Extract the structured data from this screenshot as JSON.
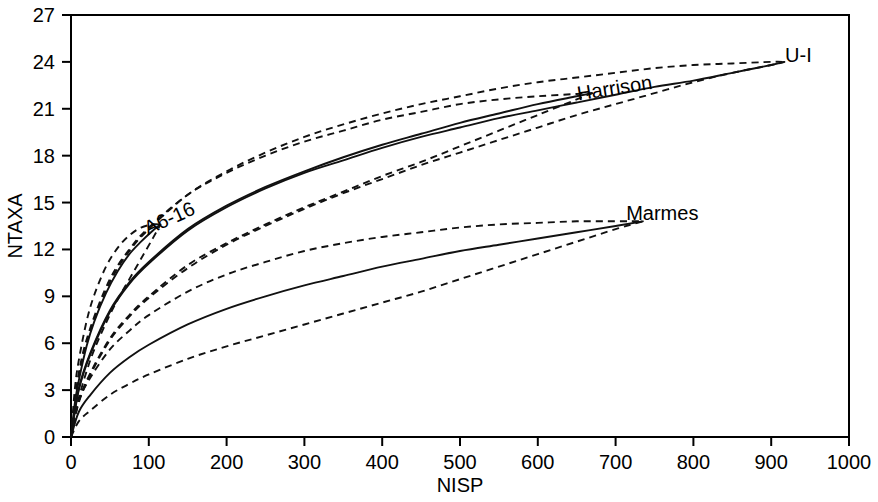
{
  "chart_data": {
    "type": "line",
    "title": "",
    "xlabel": "NISP",
    "ylabel": "NTAXA",
    "xlim": [
      0,
      1000
    ],
    "ylim": [
      0,
      27
    ],
    "xticks": [
      0,
      100,
      200,
      300,
      400,
      500,
      600,
      700,
      800,
      900,
      1000
    ],
    "yticks": [
      0,
      3,
      6,
      9,
      12,
      15,
      18,
      21,
      24,
      27
    ],
    "grid": false,
    "legend_position": "inline-annotations",
    "annotations": [
      {
        "text": "U-I",
        "x": 935,
        "y": 24.0
      },
      {
        "text": "Harrison",
        "x": 700,
        "y": 21.9
      },
      {
        "text": "A6-16",
        "x": 130,
        "y": 13.6
      },
      {
        "text": "Marmes",
        "x": 760,
        "y": 13.9
      }
    ],
    "series": [
      {
        "name": "U-I",
        "style": "solid",
        "role": "rarefaction-curve",
        "x": [
          0,
          10,
          25,
          50,
          75,
          100,
          150,
          200,
          250,
          300,
          350,
          400,
          450,
          500,
          550,
          600,
          650,
          700,
          750,
          800,
          850,
          900,
          917
        ],
        "y": [
          0,
          3.0,
          5.3,
          8.0,
          9.8,
          11.1,
          13.2,
          14.7,
          15.9,
          16.9,
          17.7,
          18.5,
          19.2,
          19.8,
          20.4,
          20.9,
          21.4,
          21.9,
          22.4,
          22.8,
          23.3,
          23.8,
          24.0
        ]
      },
      {
        "name": "U-I upper CI",
        "style": "dashed",
        "role": "confidence-upper",
        "x": [
          0,
          10,
          25,
          50,
          75,
          100,
          150,
          200,
          250,
          300,
          350,
          400,
          450,
          500,
          550,
          600,
          650,
          700,
          750,
          800,
          850,
          900,
          917
        ],
        "y": [
          0,
          3.9,
          6.8,
          9.9,
          11.9,
          13.3,
          15.5,
          17.0,
          18.2,
          19.2,
          20.0,
          20.7,
          21.3,
          21.8,
          22.3,
          22.7,
          23.0,
          23.3,
          23.6,
          23.8,
          23.9,
          24.0,
          24.0
        ]
      },
      {
        "name": "U-I lower CI",
        "style": "dashed",
        "role": "confidence-lower",
        "x": [
          0,
          10,
          25,
          50,
          75,
          100,
          150,
          200,
          250,
          300,
          350,
          400,
          450,
          500,
          550,
          600,
          650,
          700,
          750,
          800,
          850,
          900,
          917
        ],
        "y": [
          0,
          2.2,
          4.0,
          6.2,
          7.7,
          8.9,
          10.8,
          12.3,
          13.5,
          14.6,
          15.6,
          16.5,
          17.4,
          18.2,
          19.0,
          19.8,
          20.6,
          21.3,
          22.0,
          22.7,
          23.3,
          23.8,
          24.0
        ]
      },
      {
        "name": "Harrison",
        "style": "solid",
        "role": "rarefaction-curve",
        "x": [
          0,
          10,
          25,
          50,
          75,
          100,
          150,
          200,
          250,
          300,
          350,
          400,
          450,
          500,
          550,
          600,
          650,
          670
        ],
        "y": [
          0,
          3.1,
          5.4,
          8.1,
          9.9,
          11.2,
          13.3,
          14.8,
          16.0,
          17.0,
          17.9,
          18.7,
          19.4,
          20.1,
          20.7,
          21.3,
          21.8,
          22.0
        ]
      },
      {
        "name": "Harrison upper CI",
        "style": "dashed",
        "role": "confidence-upper",
        "x": [
          0,
          10,
          25,
          50,
          75,
          100,
          150,
          200,
          250,
          300,
          350,
          400,
          450,
          500,
          550,
          600,
          650,
          670
        ],
        "y": [
          0,
          4.1,
          7.0,
          10.1,
          12.0,
          13.4,
          15.5,
          16.9,
          18.0,
          18.9,
          19.6,
          20.3,
          20.8,
          21.3,
          21.6,
          21.8,
          21.95,
          22.0
        ]
      },
      {
        "name": "Harrison lower CI",
        "style": "dashed",
        "role": "confidence-lower",
        "x": [
          0,
          10,
          25,
          50,
          75,
          100,
          150,
          200,
          250,
          300,
          350,
          400,
          450,
          500,
          550,
          600,
          650,
          670
        ],
        "y": [
          0,
          2.3,
          4.1,
          6.3,
          7.8,
          9.0,
          11.0,
          12.4,
          13.6,
          14.7,
          15.7,
          16.7,
          17.6,
          18.6,
          19.6,
          20.6,
          21.6,
          22.0
        ]
      },
      {
        "name": "A6-16",
        "style": "solid",
        "role": "rarefaction-curve",
        "x": [
          0,
          5,
          10,
          20,
          30,
          45,
          60,
          75,
          90,
          105,
          115
        ],
        "y": [
          0,
          2.2,
          3.6,
          5.8,
          7.4,
          9.2,
          10.6,
          11.7,
          12.5,
          13.2,
          13.6
        ]
      },
      {
        "name": "A6-16 upper CI",
        "style": "dashed",
        "role": "confidence-upper",
        "x": [
          0,
          5,
          10,
          20,
          30,
          45,
          60,
          75,
          90,
          105,
          115
        ],
        "y": [
          0,
          3.1,
          4.9,
          7.4,
          9.1,
          10.9,
          12.1,
          12.9,
          13.4,
          13.6,
          13.6
        ]
      },
      {
        "name": "A6-16 lower CI",
        "style": "dashed",
        "role": "confidence-lower",
        "x": [
          0,
          5,
          10,
          20,
          30,
          45,
          60,
          75,
          90,
          105,
          115
        ],
        "y": [
          0,
          1.5,
          2.5,
          4.2,
          5.6,
          7.3,
          8.8,
          10.1,
          11.4,
          12.7,
          13.6
        ]
      },
      {
        "name": "Marmes",
        "style": "solid",
        "role": "rarefaction-curve",
        "x": [
          0,
          10,
          25,
          50,
          75,
          100,
          150,
          200,
          250,
          300,
          350,
          400,
          450,
          500,
          550,
          600,
          650,
          700,
          735
        ],
        "y": [
          0,
          1.6,
          2.7,
          4.1,
          5.1,
          5.9,
          7.2,
          8.2,
          9.0,
          9.7,
          10.3,
          10.9,
          11.4,
          11.9,
          12.3,
          12.7,
          13.1,
          13.5,
          13.8
        ]
      },
      {
        "name": "Marmes upper CI",
        "style": "dashed",
        "role": "confidence-upper",
        "x": [
          0,
          10,
          25,
          50,
          75,
          100,
          150,
          200,
          250,
          300,
          350,
          400,
          450,
          500,
          550,
          600,
          650,
          700,
          735
        ],
        "y": [
          0,
          2.3,
          3.8,
          5.6,
          6.8,
          7.8,
          9.3,
          10.4,
          11.2,
          11.9,
          12.4,
          12.8,
          13.1,
          13.4,
          13.6,
          13.7,
          13.8,
          13.8,
          13.8
        ]
      },
      {
        "name": "Marmes lower CI",
        "style": "dashed",
        "role": "confidence-lower",
        "x": [
          0,
          10,
          25,
          50,
          75,
          100,
          150,
          200,
          250,
          300,
          350,
          400,
          450,
          500,
          550,
          600,
          650,
          700,
          735
        ],
        "y": [
          0,
          1.0,
          1.7,
          2.7,
          3.4,
          4.0,
          5.0,
          5.8,
          6.5,
          7.2,
          7.9,
          8.6,
          9.3,
          10.1,
          10.9,
          11.7,
          12.5,
          13.3,
          13.8
        ]
      }
    ]
  }
}
